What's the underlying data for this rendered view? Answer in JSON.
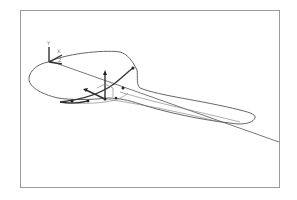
{
  "figure": {
    "axes": {
      "labels": {
        "y": "Y",
        "x": "X",
        "z": "Z"
      }
    },
    "colors": {
      "frame": "#9a9a9a",
      "outline": "#555555",
      "section": "#333333",
      "background": "#ffffff"
    },
    "control_point_count": 6
  }
}
